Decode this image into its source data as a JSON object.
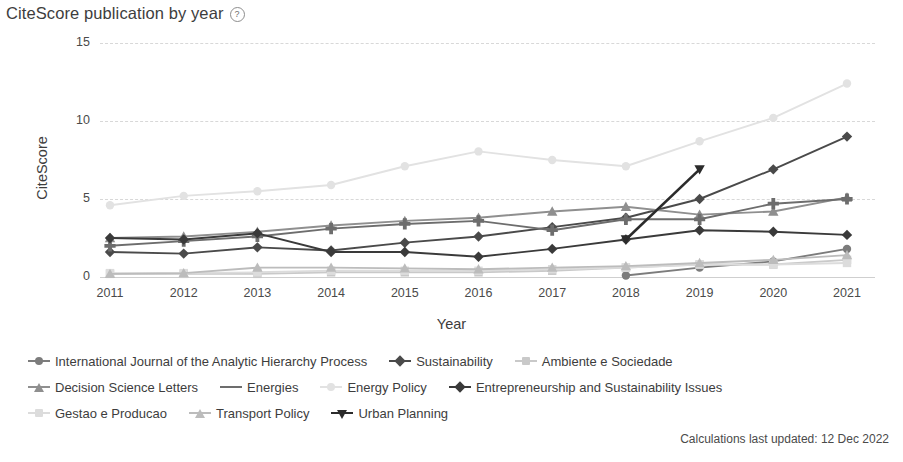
{
  "header": {
    "title": "CiteScore publication by year",
    "help_icon": "question-circle-icon"
  },
  "footer": {
    "note": "Calculations last updated: 12 Dec 2022"
  },
  "chart_data": {
    "type": "line",
    "title": "CiteScore publication by year",
    "xlabel": "Year",
    "ylabel": "CiteScore",
    "categories": [
      "2011",
      "2012",
      "2013",
      "2014",
      "2015",
      "2016",
      "2017",
      "2018",
      "2019",
      "2020",
      "2021"
    ],
    "x": [
      2011,
      2012,
      2013,
      2014,
      2015,
      2016,
      2017,
      2018,
      2019,
      2020,
      2021
    ],
    "ylim": [
      0,
      15
    ],
    "yticks": [
      0,
      5,
      10,
      15
    ],
    "grid": true,
    "legend_position": "bottom-left",
    "series": [
      {
        "name": "International Journal of the Analytic Hierarchy Process",
        "color": "#7c7c7c",
        "marker": "circle",
        "values": [
          null,
          null,
          null,
          null,
          null,
          null,
          null,
          0.1,
          0.6,
          1.0,
          1.8
        ]
      },
      {
        "name": "Sustainability",
        "color": "#4a4a4a",
        "marker": "diamond",
        "values": [
          1.6,
          1.5,
          1.9,
          1.7,
          2.2,
          2.6,
          3.2,
          3.8,
          5.0,
          6.9,
          9.0
        ]
      },
      {
        "name": "Ambiente e Sociedade",
        "color": "#c9c9c9",
        "marker": "square",
        "values": [
          0.2,
          0.2,
          0.2,
          0.3,
          0.3,
          0.3,
          0.4,
          0.6,
          0.8,
          0.8,
          1.1
        ]
      },
      {
        "name": "Decision Science Letters",
        "color": "#8f8f8f",
        "marker": "triangle",
        "values": [
          2.5,
          2.6,
          2.9,
          3.3,
          3.6,
          3.8,
          4.2,
          4.5,
          4.0,
          4.2,
          5.1
        ]
      },
      {
        "name": "Energies",
        "color": "#6d6d6d",
        "marker": "plus",
        "values": [
          2.0,
          2.3,
          2.6,
          3.1,
          3.4,
          3.6,
          3.0,
          3.7,
          3.7,
          4.7,
          5.0
        ]
      },
      {
        "name": "Energy Policy",
        "color": "#e2e2e2",
        "marker": "circle",
        "values": [
          4.6,
          5.2,
          5.5,
          5.9,
          7.1,
          8.05,
          7.5,
          7.1,
          8.7,
          10.2,
          12.4
        ]
      },
      {
        "name": "Entrepreneurship and Sustainability Issues",
        "color": "#3a3a3a",
        "marker": "diamond",
        "values": [
          2.5,
          2.4,
          2.8,
          1.6,
          1.6,
          1.3,
          1.8,
          2.4,
          3.0,
          2.9,
          2.7
        ]
      },
      {
        "name": "Gestao e Producao",
        "color": "#dcdcdc",
        "marker": "square",
        "values": [
          0.25,
          0.25,
          0.3,
          0.4,
          0.4,
          0.4,
          0.5,
          0.6,
          0.8,
          0.8,
          0.9
        ]
      },
      {
        "name": "Transport Policy",
        "color": "#bcbcbc",
        "marker": "triangle",
        "values": [
          0.2,
          0.25,
          0.6,
          0.6,
          0.55,
          0.5,
          0.6,
          0.7,
          0.9,
          1.1,
          1.4
        ]
      },
      {
        "name": "Urban Planning",
        "color": "#2b2b2b",
        "marker": "triangle-down",
        "values": [
          null,
          null,
          null,
          null,
          null,
          null,
          null,
          2.4,
          6.9,
          null,
          null
        ]
      }
    ]
  },
  "legend": {
    "rows": [
      [
        {
          "label": "International Journal of the Analytic Hierarchy Process",
          "marker": "circle",
          "color": "#7c7c7c"
        },
        {
          "label": "Sustainability",
          "marker": "diamond",
          "color": "#4a4a4a"
        },
        {
          "label": "Ambiente e Sociedade",
          "marker": "square",
          "color": "#c9c9c9"
        }
      ],
      [
        {
          "label": "Decision Science Letters",
          "marker": "triangle",
          "color": "#8f8f8f"
        },
        {
          "label": "Energies",
          "marker": "plus",
          "color": "#6d6d6d"
        },
        {
          "label": "Energy Policy",
          "marker": "circle",
          "color": "#e2e2e2"
        },
        {
          "label": "Entrepreneurship and Sustainability Issues",
          "marker": "diamond",
          "color": "#3a3a3a"
        }
      ],
      [
        {
          "label": "Gestao e Producao",
          "marker": "square",
          "color": "#dcdcdc"
        },
        {
          "label": "Transport Policy",
          "marker": "triangle",
          "color": "#bcbcbc"
        },
        {
          "label": "Urban Planning",
          "marker": "triangle-down",
          "color": "#2b2b2b"
        }
      ]
    ]
  }
}
